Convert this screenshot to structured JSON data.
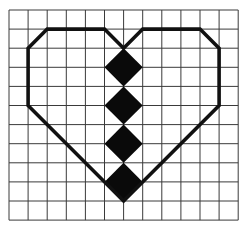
{
  "figure": {
    "grid": {
      "columns": 12,
      "rows": 11,
      "origin_x": 9,
      "origin_y": 10,
      "cell_w": 19.1,
      "cell_h": 19.1,
      "line_color": "#3a3a3a",
      "line_width": 1
    },
    "heart": {
      "stroke_color": "#111111",
      "stroke_width": 3.6,
      "vertices_grid": [
        [
          2,
          1
        ],
        [
          5,
          1
        ],
        [
          6,
          2
        ],
        [
          7,
          1
        ],
        [
          10,
          1
        ],
        [
          11,
          2
        ],
        [
          11,
          5
        ],
        [
          6,
          10
        ],
        [
          1,
          5
        ],
        [
          1,
          2
        ]
      ]
    },
    "diamonds": {
      "fill": "#0a0a0a",
      "center_col": 6,
      "half_width": 1,
      "half_height": 1,
      "center_rows": [
        3,
        5,
        7,
        9
      ]
    }
  }
}
